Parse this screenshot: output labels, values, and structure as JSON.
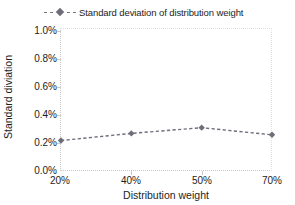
{
  "legend": {
    "entries": [
      {
        "label": "Standard deviation of distribution  weight",
        "color": "#6e6e7a",
        "marker": "diamond-marker-icon",
        "line_style": "dashed"
      }
    ]
  },
  "axes": {
    "x": {
      "title": "Distribution weight",
      "tick_labels": [
        "20%",
        "40%",
        "50%",
        "70%"
      ]
    },
    "y": {
      "title": "Standard diviation",
      "tick_labels": [
        "0.0%",
        "0.2%",
        "0.4%",
        "0.6%",
        "0.8%",
        "1.0%"
      ]
    }
  },
  "chart_data": {
    "type": "line",
    "title": "",
    "xlabel": "Distribution weight",
    "ylabel": "Standard diviation",
    "categories": [
      "20%",
      "40%",
      "50%",
      "70%"
    ],
    "series": [
      {
        "name": "Standard deviation of distribution  weight",
        "values": [
          0.22,
          0.27,
          0.31,
          0.26
        ],
        "color": "#6e6e7a",
        "line_style": "dashed",
        "marker": "diamond"
      }
    ],
    "ylim": [
      0.0,
      1.0
    ],
    "yticks": [
      0.0,
      0.2,
      0.4,
      0.6,
      0.8,
      1.0
    ],
    "ytick_labels": [
      "0.0%",
      "0.2%",
      "0.4%",
      "0.6%",
      "0.8%",
      "1.0%"
    ],
    "xtick_labels": [
      "20%",
      "40%",
      "50%",
      "70%"
    ],
    "value_unit": "%",
    "grid": false,
    "legend_position": "top"
  },
  "colors": {
    "series": "#6e6e7a",
    "axis": "#c9c9c9",
    "text": "#1d1d1d",
    "background": "#ffffff"
  }
}
